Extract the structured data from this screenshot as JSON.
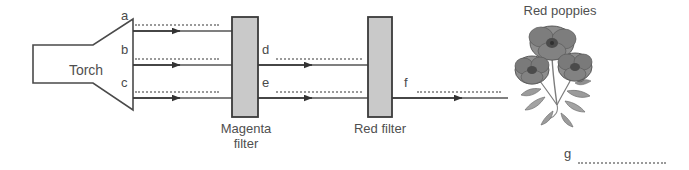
{
  "diagram": {
    "title_of_scene": "Light through colour filters onto red poppies",
    "torch": {
      "label": "Torch"
    },
    "filters": [
      {
        "id": "magenta-filter",
        "label_line1": "Magenta",
        "label_line2": "filter",
        "fill_color": "#c9c9c9",
        "stroke_color": "#3a3a3a"
      },
      {
        "id": "red-filter",
        "label_line1": "Red filter",
        "label_line2": "",
        "fill_color": "#c9c9c9",
        "stroke_color": "#3a3a3a"
      }
    ],
    "object": {
      "label": "Red poppies",
      "illustration": "poppy-flowers-illustration"
    },
    "ray_labels": [
      {
        "id": "a",
        "text": "a",
        "section": "torch-to-magenta",
        "ray_index": 0
      },
      {
        "id": "b",
        "text": "b",
        "section": "torch-to-magenta",
        "ray_index": 1
      },
      {
        "id": "c",
        "text": "c",
        "section": "torch-to-magenta",
        "ray_index": 2
      },
      {
        "id": "d",
        "text": "d",
        "section": "magenta-to-red",
        "ray_index": 1
      },
      {
        "id": "e",
        "text": "e",
        "section": "magenta-to-red",
        "ray_index": 2
      },
      {
        "id": "f",
        "text": "f",
        "section": "red-to-poppies",
        "ray_index": 2
      },
      {
        "id": "g",
        "text": "g",
        "section": "below-poppies",
        "ray_index": -1
      }
    ],
    "answer_blank_style": "dotted-line",
    "line_color": "#555555",
    "arrow_color": "#333333",
    "background_color": "#ffffff"
  }
}
